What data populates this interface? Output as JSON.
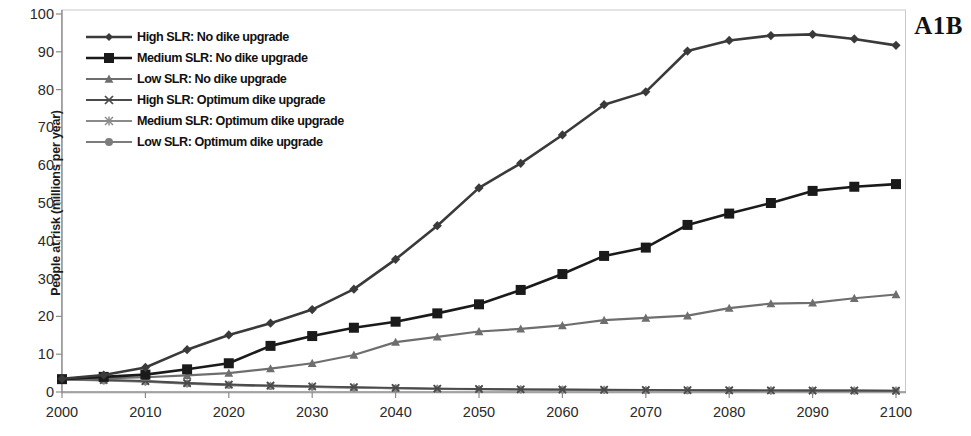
{
  "panel": {
    "label": "A1B"
  },
  "axes": {
    "ylabel": "People at risk (millions per year)",
    "xlabel": "",
    "yticks": [
      "0",
      "10",
      "20",
      "30",
      "40",
      "50",
      "60",
      "70",
      "80",
      "90",
      "100"
    ],
    "xticks": [
      "2000",
      "2010",
      "2020",
      "2030",
      "2040",
      "2050",
      "2060",
      "2070",
      "2080",
      "2090",
      "2100"
    ]
  },
  "legend": [
    {
      "label": "High SLR: No dike upgrade",
      "marker": "diamond-marker",
      "color": "#3a3a3a"
    },
    {
      "label": "Medium SLR: No dike upgrade",
      "marker": "square-marker",
      "color": "#1a1a1a"
    },
    {
      "label": "Low SLR: No dike upgrade",
      "marker": "triangle-marker",
      "color": "#6e6e6e"
    },
    {
      "label": "High SLR: Optimum dike upgrade",
      "marker": "cross-marker",
      "color": "#4a4a4a"
    },
    {
      "label": "Medium SLR:  Optimum dike upgrade",
      "marker": "asterisk-marker",
      "color": "#8a8a8a"
    },
    {
      "label": "Low SLR: Optimum dike upgrade",
      "marker": "circle-marker",
      "color": "#7c7c7c"
    }
  ],
  "chart_data": {
    "type": "line",
    "title": "",
    "xlabel": "",
    "ylabel": "People at risk (millions per year)",
    "xlim": [
      2000,
      2100
    ],
    "ylim": [
      0,
      100
    ],
    "grid": false,
    "legend_position": "top-left",
    "x": [
      2000,
      2005,
      2010,
      2015,
      2020,
      2025,
      2030,
      2035,
      2040,
      2045,
      2050,
      2055,
      2060,
      2065,
      2070,
      2075,
      2080,
      2085,
      2090,
      2095,
      2100
    ],
    "series": [
      {
        "name": "High SLR: No dike upgrade",
        "marker": "diamond-marker",
        "color": "#3a3a3a",
        "values": [
          3.5,
          4.5,
          6.5,
          11.2,
          15.1,
          18.2,
          21.8,
          27.2,
          35.1,
          44.0,
          54.0,
          60.5,
          68.0,
          76.0,
          79.4,
          90.2,
          93.0,
          94.3,
          94.6,
          93.4,
          91.7
        ]
      },
      {
        "name": "Medium SLR: No dike upgrade",
        "marker": "square-marker",
        "color": "#1a1a1a",
        "values": [
          3.4,
          4.0,
          4.6,
          6.0,
          7.6,
          12.2,
          14.8,
          17.0,
          18.6,
          20.8,
          23.2,
          27.0,
          31.2,
          36.0,
          38.2,
          44.2,
          47.2,
          50.0,
          53.2,
          54.3,
          55.0
        ]
      },
      {
        "name": "Low SLR: No dike upgrade",
        "marker": "triangle-marker",
        "color": "#6e6e6e",
        "values": [
          3.3,
          3.6,
          3.9,
          4.4,
          5.0,
          6.2,
          7.6,
          9.8,
          13.2,
          14.6,
          16.0,
          16.7,
          17.6,
          19.0,
          19.6,
          20.2,
          22.2,
          23.4,
          23.6,
          24.8,
          25.8
        ]
      },
      {
        "name": "High SLR: Optimum dike upgrade",
        "marker": "cross-marker",
        "color": "#4a4a4a",
        "values": [
          3.4,
          3.2,
          2.9,
          2.4,
          2.0,
          1.7,
          1.5,
          1.3,
          1.1,
          0.9,
          0.8,
          0.7,
          0.65,
          0.6,
          0.55,
          0.5,
          0.45,
          0.42,
          0.4,
          0.38,
          0.35
        ]
      },
      {
        "name": "Medium SLR:  Optimum dike upgrade",
        "marker": "asterisk-marker",
        "color": "#8a8a8a",
        "values": [
          3.4,
          3.1,
          2.8,
          2.3,
          1.9,
          1.6,
          1.4,
          1.2,
          1.0,
          0.85,
          0.75,
          0.68,
          0.6,
          0.55,
          0.5,
          0.46,
          0.42,
          0.4,
          0.38,
          0.35,
          0.33
        ]
      },
      {
        "name": "Low SLR: Optimum dike upgrade",
        "marker": "circle-marker",
        "color": "#7c7c7c",
        "values": [
          3.3,
          3.0,
          2.7,
          2.2,
          1.8,
          1.5,
          1.3,
          1.1,
          0.95,
          0.8,
          0.7,
          0.62,
          0.56,
          0.5,
          0.46,
          0.42,
          0.4,
          0.37,
          0.35,
          0.33,
          0.3
        ]
      }
    ]
  }
}
